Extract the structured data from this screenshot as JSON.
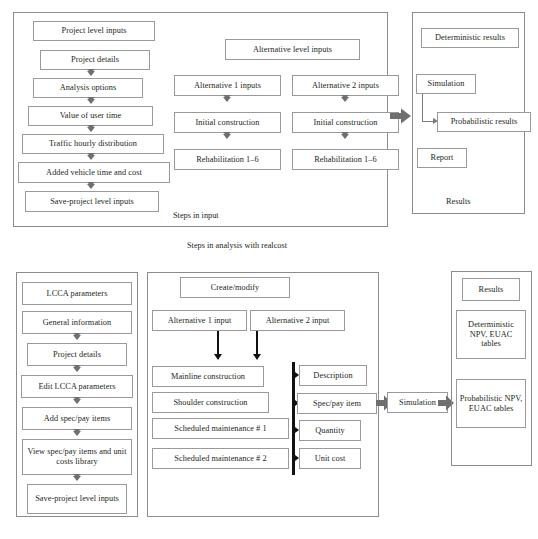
{
  "figure": {
    "caption_top": "Steps in analysis with realcost"
  },
  "top_diagram": {
    "input_panel": {
      "label": "Steps in input",
      "project_level_column": [
        "Project level inputs",
        "Project details",
        "Analysis options",
        "Value of user time",
        "Traffic hourly distribution",
        "Added vehicle time and cost",
        "Save-project level inputs"
      ],
      "alternative_header": "Alternative level inputs",
      "alternative_1": [
        "Alternative 1 inputs",
        "Initial construction",
        "Rehabilitation 1–6"
      ],
      "alternative_2": [
        "Alternative 2 inputs",
        "Initial construction",
        "Rehabilitation 1–6"
      ]
    },
    "results_panel": {
      "label": "Results",
      "items": [
        "Deterministic results",
        "Simulation",
        "Probabilistic results",
        "Report"
      ]
    }
  },
  "bottom_diagram": {
    "lcca_panel": {
      "items": [
        "LCCA parameters",
        "General information",
        "Project details",
        "Edit LCCA parameters",
        "Add spec/pay items",
        "View spec/pay items and unit costs library",
        "Save-project level inputs"
      ]
    },
    "create_panel": {
      "header": "Create/modify",
      "alternatives": [
        "Alternative 1 input",
        "Alternative 2 input"
      ],
      "activities": [
        "Mainline construction",
        "Shoulder construction",
        "Scheduled maintenance # 1",
        "Scheduled maintenance # 2"
      ],
      "attributes": [
        "Description",
        "Spec/pay item",
        "Quantity",
        "Unit cost"
      ]
    },
    "simulation_label": "Simulation",
    "results_panel": {
      "items": [
        "Results",
        "Deterministic NPV, EUAC tables",
        "Probabilistic NPV, EUAC tables"
      ]
    }
  },
  "colors": {
    "ink": "#231f20",
    "box_border": "#9a9a9a",
    "panel_border": "#8c8c8c",
    "arrow_gray": "#6f6f6f",
    "arrow_black": "#111111"
  }
}
